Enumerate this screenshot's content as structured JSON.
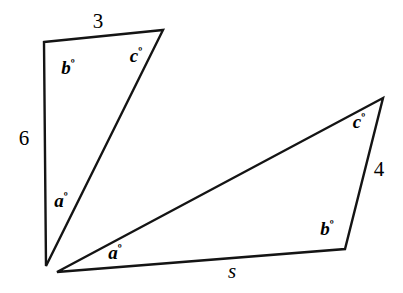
{
  "figure": {
    "stroke_color": "#141414",
    "background_color": "#ffffff",
    "left_triangle": {
      "name": "left-triangle",
      "vertices": [
        [
          44,
          42
        ],
        [
          163,
          30
        ],
        [
          46,
          266
        ]
      ],
      "side_labels": [
        {
          "key": "top",
          "text": "3",
          "x": 98,
          "y": 21,
          "style": "upright"
        },
        {
          "key": "left",
          "text": "6",
          "x": 24,
          "y": 138,
          "style": "upright"
        }
      ],
      "angle_labels": [
        {
          "key": "b",
          "letter": "b",
          "degree": "º",
          "x": 68,
          "y": 67
        },
        {
          "key": "c",
          "letter": "c",
          "degree": "º",
          "x": 136,
          "y": 55
        },
        {
          "key": "a",
          "letter": "a",
          "degree": "º",
          "x": 61,
          "y": 200
        }
      ]
    },
    "right_triangle": {
      "name": "right-triangle",
      "vertices": [
        [
          57,
          272
        ],
        [
          383,
          98
        ],
        [
          345,
          249
        ]
      ],
      "side_labels": [
        {
          "key": "bottom",
          "text": "s",
          "x": 232,
          "y": 271,
          "style": "italic"
        },
        {
          "key": "right",
          "text": "4",
          "x": 379,
          "y": 169,
          "style": "upright"
        }
      ],
      "angle_labels": [
        {
          "key": "a",
          "letter": "a",
          "degree": "º",
          "x": 115,
          "y": 252
        },
        {
          "key": "c",
          "letter": "c",
          "degree": "º",
          "x": 359,
          "y": 121
        },
        {
          "key": "b",
          "letter": "b",
          "degree": "º",
          "x": 327,
          "y": 228
        }
      ]
    }
  }
}
